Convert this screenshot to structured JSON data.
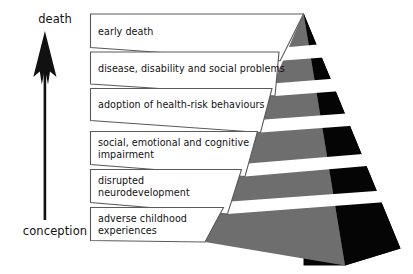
{
  "figure": {
    "axis": {
      "top_label": "death",
      "bottom_label": "conception",
      "arrow_icon": "upward-arrow-icon",
      "direction": "up"
    },
    "colors": {
      "front_face": "#6e6e6e",
      "side_face": "#050505",
      "box_fill": "#ffffff",
      "box_stroke": "#5a5a5a",
      "text": "#111111",
      "background": "#ffffff"
    },
    "levels": [
      {
        "index": 1,
        "label": "early death"
      },
      {
        "index": 2,
        "label": "disease, disability and social problems"
      },
      {
        "index": 3,
        "label": "adoption of health-risk behaviours"
      },
      {
        "index": 4,
        "label": "social, emotional and cognitive\nimpairment"
      },
      {
        "index": 5,
        "label": "disrupted\nneurodevelopment"
      },
      {
        "index": 6,
        "label": "adverse childhood\nexperiences"
      }
    ]
  }
}
